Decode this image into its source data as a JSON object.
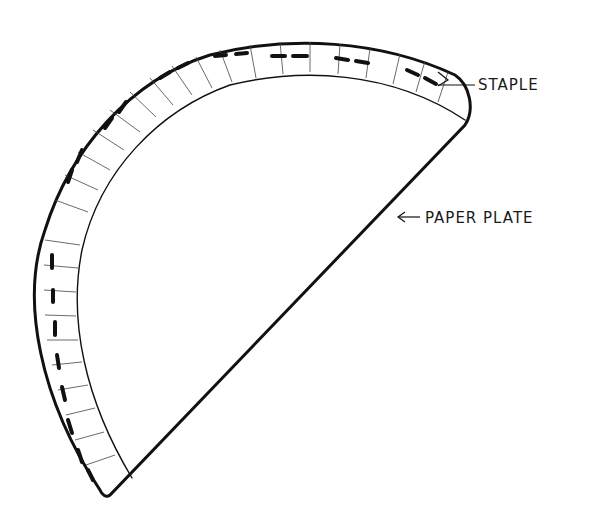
{
  "diagram": {
    "labels": {
      "staple": "STAPLE",
      "paper_plate": "PAPER PLATE"
    },
    "colors": {
      "stroke": "#111111",
      "background": "#ffffff"
    }
  }
}
